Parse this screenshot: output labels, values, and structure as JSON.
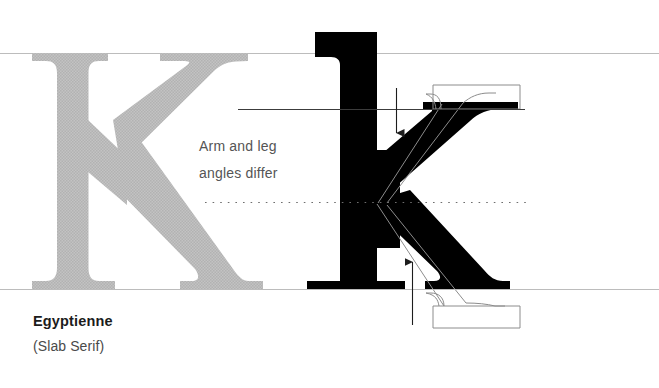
{
  "figure": {
    "kind": "typography-specimen-diagram",
    "background_color": "#ffffff",
    "ghost_letter": {
      "glyph": "K",
      "case": "uppercase",
      "style": "serif-reference",
      "fill_color": "#bdbdbd"
    },
    "specimen_letter": {
      "glyph": "k",
      "case": "lowercase",
      "style": "slab-serif",
      "fill_color": "#000000"
    },
    "overlay_outline": {
      "description": "comparison-letter-outline",
      "stroke_color": "#8a8a8a"
    },
    "guides": {
      "cap_line_color": "#b9b9b9",
      "x_height_line_color": "#3a3a3a",
      "baseline_color": "#b9b9b9",
      "stem_axis_color": "#555555",
      "dotted_line_color": "#6e6e6e"
    },
    "arrows": {
      "color": "#222222",
      "down_arrow": "arm-angle-pointer",
      "up_arrow": "leg-angle-pointer"
    }
  },
  "annotation": {
    "line1": "Arm and leg",
    "line2": "angles differ"
  },
  "caption": {
    "title": "Egyptienne",
    "subtitle": "(Slab Serif)"
  }
}
